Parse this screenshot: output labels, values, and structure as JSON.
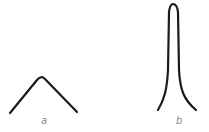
{
  "diagram": {
    "curves": [
      {
        "id": "a",
        "label": "a",
        "shape": "broad-peak",
        "color": "#1a1a1a"
      },
      {
        "id": "b",
        "label": "b",
        "shape": "sharp-peak",
        "color": "#1a1a1a"
      }
    ],
    "label_color": "#8a8a8a"
  }
}
